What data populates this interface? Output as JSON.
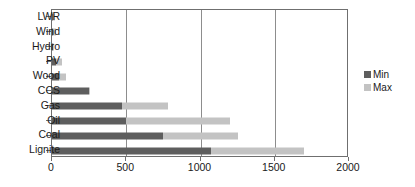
{
  "chart_data": {
    "type": "bar",
    "orientation": "horizontal",
    "title": "",
    "xlabel": "",
    "ylabel": "",
    "xlim": [
      0,
      2000
    ],
    "xticks": [
      0,
      500,
      1000,
      1500,
      2000
    ],
    "xtick_labels": [
      "0",
      "500",
      "1000",
      "1500",
      "2000"
    ],
    "grid": true,
    "grid_axis": "x",
    "legend_position": "right",
    "categories": [
      "LWR",
      "Wind",
      "Hydro",
      "PV",
      "Wood",
      "CCS",
      "Gas",
      "Oil",
      "Coal",
      "Lignite"
    ],
    "series": [
      {
        "name": "Min",
        "color": "#5e5e5e",
        "values": [
          5,
          10,
          4,
          30,
          45,
          250,
          470,
          500,
          750,
          1070
        ]
      },
      {
        "name": "Max",
        "color": "#c3c3c3",
        "values": [
          20,
          30,
          15,
          65,
          95,
          255,
          780,
          1200,
          1250,
          1700
        ]
      }
    ]
  },
  "legend": {
    "entries": [
      {
        "label": "Min",
        "color": "#5e5e5e"
      },
      {
        "label": "Max",
        "color": "#c3c3c3"
      }
    ]
  }
}
